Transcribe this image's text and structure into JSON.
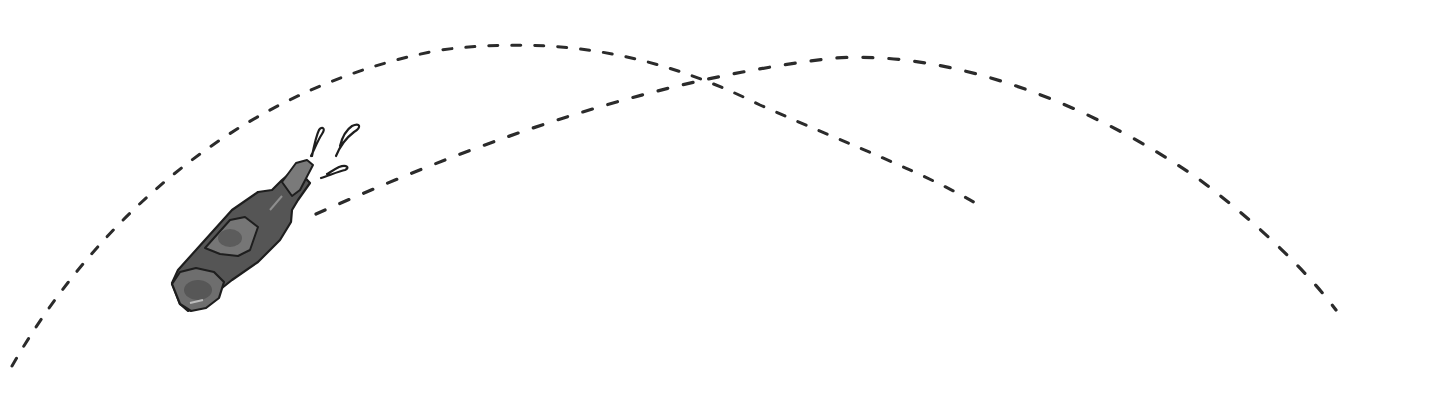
{
  "illustration": {
    "subject": "bottle-with-dashed-trajectories",
    "ink_color": "#2b2b2b",
    "bottle_fill_dark": "#4a4a4a",
    "bottle_fill_light": "#8a8a8a",
    "background": "#ffffff",
    "elements": [
      {
        "name": "outer-arc-trajectory",
        "style": "dashed"
      },
      {
        "name": "inner-arc-trajectory",
        "style": "dashed"
      },
      {
        "name": "bottle",
        "style": "sketch"
      },
      {
        "name": "droplets",
        "count": 3
      }
    ]
  }
}
